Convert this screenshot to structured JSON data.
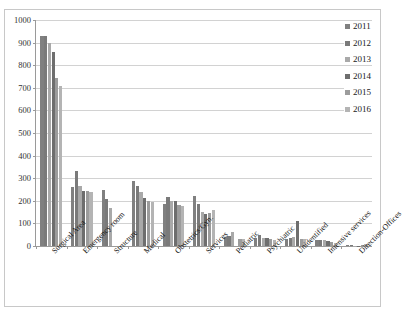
{
  "clipped_caption": "",
  "legend": {
    "position": "top-right",
    "entries": [
      {
        "label": "2011",
        "color": "#808080"
      },
      {
        "label": "2012",
        "color": "#7a7a7a"
      },
      {
        "label": "2013",
        "color": "#a9a9a9"
      },
      {
        "label": "2014",
        "color": "#6e6e6e"
      },
      {
        "label": "2015",
        "color": "#9c9c9c"
      },
      {
        "label": "2016",
        "color": "#b4b4b4"
      }
    ]
  },
  "axis": {
    "y_ticks": [
      "0",
      "100",
      "200",
      "300",
      "400",
      "500",
      "600",
      "700",
      "800",
      "900",
      "1000"
    ]
  },
  "chart_data": {
    "type": "bar",
    "title": "",
    "subtitle": "",
    "xlabel": "",
    "ylabel": "",
    "ylim": [
      0,
      1000
    ],
    "ytick_step": 100,
    "grid": true,
    "legend_position": "top-right",
    "categories": [
      "Surgical Area",
      "Emergency room",
      "Structure",
      "Medical",
      "Obstetrics/Gyn.",
      "Services",
      "Pediatric",
      "Psychiatric",
      "Unidentified",
      "Intensive services",
      "Direction-Offices"
    ],
    "series": [
      {
        "name": "2011",
        "color": "#808080",
        "values": [
          930,
          262,
          250,
          288,
          185,
          220,
          40,
          35,
          33,
          25,
          3
        ]
      },
      {
        "name": "2012",
        "color": "#7a7a7a",
        "values": [
          930,
          333,
          208,
          265,
          218,
          187,
          43,
          50,
          35,
          25,
          3
        ]
      },
      {
        "name": "2013",
        "color": "#a9a9a9",
        "values": [
          900,
          265,
          168,
          240,
          197,
          152,
          60,
          35,
          42,
          25,
          2
        ]
      },
      {
        "name": "2014",
        "color": "#6e6e6e",
        "values": [
          860,
          245,
          0,
          213,
          200,
          142,
          0,
          35,
          112,
          24,
          2
        ]
      },
      {
        "name": "2015",
        "color": "#9c9c9c",
        "values": [
          745,
          242,
          0,
          197,
          180,
          148,
          32,
          33,
          30,
          16,
          5
        ]
      },
      {
        "name": "2016",
        "color": "#b4b4b4",
        "values": [
          710,
          238,
          0,
          196,
          177,
          160,
          32,
          26,
          30,
          15,
          10
        ]
      }
    ]
  }
}
